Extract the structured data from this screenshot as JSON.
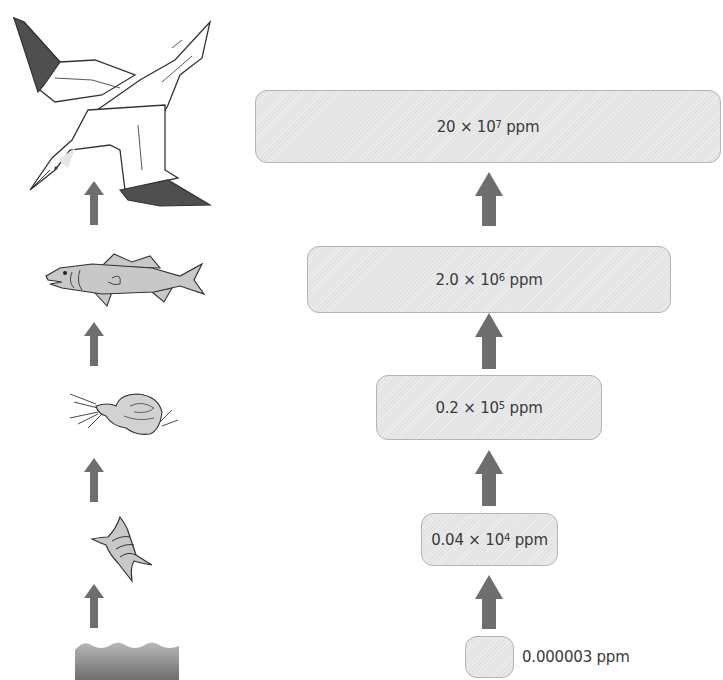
{
  "diagram": {
    "title": "",
    "colors": {
      "box_fill": "#e3e3e3",
      "box_border": "#b4b4b4",
      "arrow": "#6e6e6e",
      "dark_feather": "#4f4f4f",
      "fish_fill": "#c8c8c8"
    },
    "food_chain": [
      {
        "level": 0,
        "organism": "water",
        "icon": "water-icon"
      },
      {
        "level": 1,
        "organism": "phytoplankton",
        "icon": "phytoplankton-icon"
      },
      {
        "level": 2,
        "organism": "zooplankton",
        "icon": "zooplankton-icon"
      },
      {
        "level": 3,
        "organism": "fish",
        "icon": "fish-icon"
      },
      {
        "level": 4,
        "organism": "seabird (gannet)",
        "icon": "bird-icon"
      }
    ],
    "concentrations": [
      {
        "level": 0,
        "base": "0.000003",
        "exp": "",
        "unit": "ppm",
        "label": "0.000003 ppm"
      },
      {
        "level": 1,
        "base": "0.04 × 10",
        "exp": "4",
        "unit": " ppm"
      },
      {
        "level": 2,
        "base": "0.2 × 10",
        "exp": "5",
        "unit": " ppm"
      },
      {
        "level": 3,
        "base": "2.0 × 10",
        "exp": "6",
        "unit": " ppm"
      },
      {
        "level": 4,
        "base": "20 × 10",
        "exp": "7",
        "unit": " ppm"
      }
    ]
  }
}
